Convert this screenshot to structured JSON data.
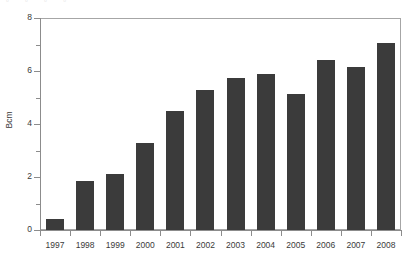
{
  "header": {
    "clipped_text": "▫ ▫ ▫ ▫"
  },
  "chart_data": {
    "type": "bar",
    "title": "",
    "xlabel": "",
    "ylabel": "Bcm",
    "categories": [
      "1997",
      "1998",
      "1999",
      "2000",
      "2001",
      "2002",
      "2003",
      "2004",
      "2005",
      "2006",
      "2007",
      "2008"
    ],
    "values": [
      0.4,
      1.85,
      2.1,
      3.3,
      4.5,
      5.3,
      5.75,
      5.9,
      5.15,
      6.4,
      6.15,
      7.05
    ],
    "ylim": [
      0,
      8
    ],
    "ytick_labels": [
      "0",
      "2",
      "4",
      "6",
      "8"
    ],
    "ytick_values": [
      0,
      2,
      4,
      6,
      8
    ],
    "yminor_values": [
      1,
      3,
      5,
      7
    ],
    "grid": false,
    "legend": "none",
    "bar_color": "#3b3b3b",
    "axis_color": "#8c8c8c",
    "frame_color": "#a6a6a6",
    "background_color": "#ffffff"
  }
}
